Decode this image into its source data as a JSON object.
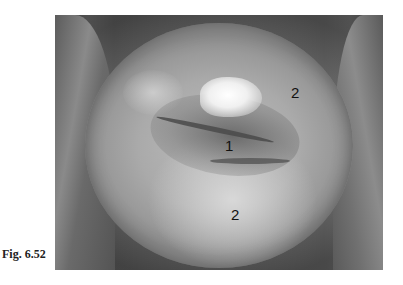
{
  "figure": {
    "caption": "Fig. 6.52",
    "image": {
      "type": "grayscale clinical photograph",
      "labels": [
        {
          "text": "1",
          "x": 230,
          "y": 146
        },
        {
          "text": "2",
          "x": 296,
          "y": 93
        },
        {
          "text": "2",
          "x": 236,
          "y": 215
        }
      ]
    }
  }
}
